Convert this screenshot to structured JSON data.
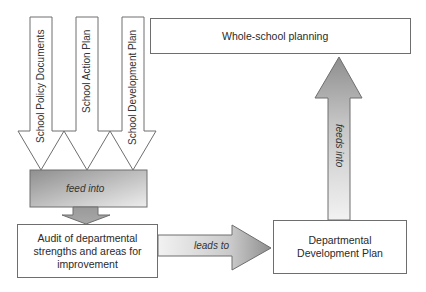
{
  "diagram": {
    "inputs": [
      {
        "label": "School Policy Documents"
      },
      {
        "label": "School Action Plan"
      },
      {
        "label": "School Development Plan"
      }
    ],
    "feed_box": {
      "label": "feed into"
    },
    "audit_box": {
      "label": "Audit of departmental strengths and areas for improvement"
    },
    "leads_arrow": {
      "label": "leads to"
    },
    "dept_box": {
      "label": "Departmental Development Plan"
    },
    "feeds_arrow": {
      "label": "feeds into"
    },
    "whole_box": {
      "label": "Whole-school planning"
    }
  },
  "colors": {
    "outline": "#6e6e6e",
    "gradient_dark": "#8f8f8f",
    "gradient_light": "#efefef"
  }
}
